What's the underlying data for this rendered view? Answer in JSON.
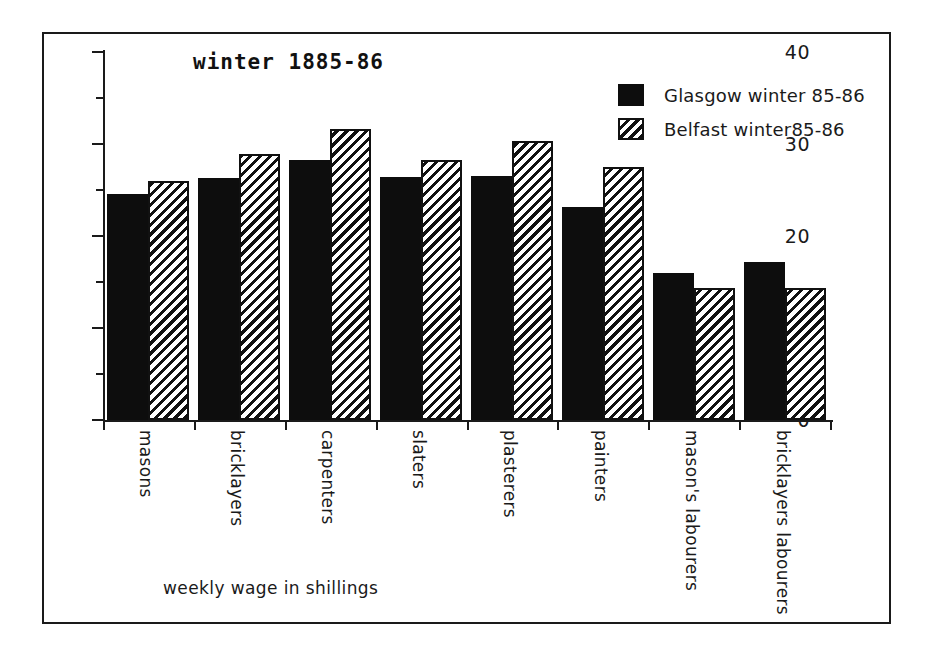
{
  "chart_data": {
    "type": "bar",
    "title": "winter 1885-86",
    "xlabel": "weekly wage in shillings",
    "ylabel": "",
    "ylim": [
      0,
      40
    ],
    "yticks": [
      0,
      10,
      20,
      30,
      40
    ],
    "ytick_labels": [
      "0",
      "10",
      "20",
      "30",
      "40"
    ],
    "yminor_ticks": [
      5,
      15,
      25,
      35
    ],
    "grid": false,
    "legend_position": "top-right",
    "categories": [
      "masons",
      "bricklayers",
      "carpenters",
      "slaters",
      "plasterers",
      "painters",
      "mason's labourers",
      "bricklayers labourers"
    ],
    "series": [
      {
        "name": "Glasgow winter 85-86",
        "fill": "solid",
        "color": "#0d0d0d",
        "values": [
          24.6,
          26.3,
          28.3,
          26.4,
          26.5,
          23.1,
          16.0,
          17.2
        ]
      },
      {
        "name": "Belfast winter85-86",
        "fill": "hatched",
        "color": "#111111",
        "values": [
          26.0,
          28.9,
          31.6,
          28.3,
          30.3,
          27.5,
          14.3,
          14.3
        ]
      }
    ]
  },
  "legend": {
    "entries": [
      {
        "label": "Glasgow winter 85-86"
      },
      {
        "label": "Belfast winter85-86"
      }
    ]
  }
}
